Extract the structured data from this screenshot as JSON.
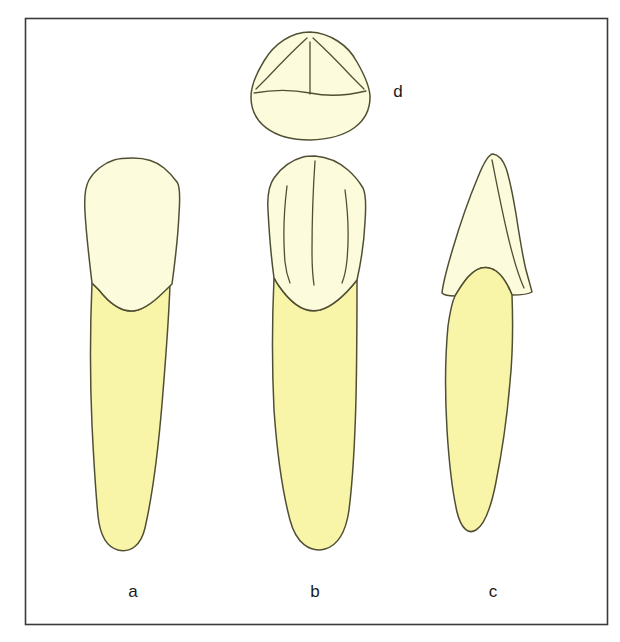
{
  "figure": {
    "background_color": "#ffffff",
    "frame": {
      "stroke_color": "#3a3a3a",
      "x": 25,
      "y": 18,
      "width": 583,
      "height": 607
    },
    "colors": {
      "enamel_fill": "#fcfcdc",
      "dentin_fill": "#f8f5a8",
      "outline": "#504f34",
      "label_text": "#1a1a1a"
    },
    "labels": [
      {
        "id": "a",
        "text": "a",
        "x": 133,
        "y": 597,
        "describes": "labial-view-tooth"
      },
      {
        "id": "b",
        "text": "b",
        "x": 315,
        "y": 597,
        "describes": "lingual-view-tooth"
      },
      {
        "id": "c",
        "text": "c",
        "x": 493,
        "y": 597,
        "describes": "proximal-view-tooth"
      },
      {
        "id": "d",
        "text": "d",
        "x": 398,
        "y": 97,
        "describes": "incisal-occlusal-view-tooth"
      }
    ],
    "views": [
      {
        "id": "a",
        "name": "labial-view",
        "label": "a",
        "crown_region": "enamel",
        "root_region": "dentin",
        "ridge_count": 0
      },
      {
        "id": "b",
        "name": "lingual-view",
        "label": "b",
        "crown_region": "enamel",
        "root_region": "dentin",
        "ridge_count": 3
      },
      {
        "id": "c",
        "name": "proximal-view",
        "label": "c",
        "crown_region": "enamel",
        "root_region": "dentin",
        "ridge_count": 1
      },
      {
        "id": "d",
        "name": "incisal-view",
        "label": "d",
        "crown_region": "enamel",
        "root_region": "none",
        "ridge_count": 4
      }
    ]
  }
}
